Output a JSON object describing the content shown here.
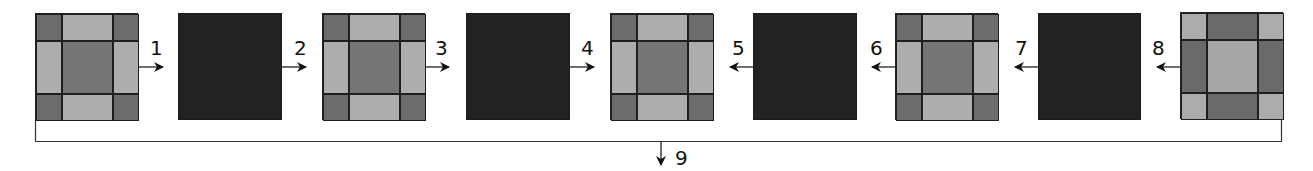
{
  "diagram": {
    "colors": {
      "corner_dark": "#6c6c6c",
      "edge_light": "#adadad",
      "center_mid": "#767676",
      "solid_dark": "#222222",
      "inv_corner_light": "#acacac",
      "inv_edge_dark": "#6a6a6a",
      "inv_center_light": "#a6a6a6",
      "line": "#222222"
    },
    "tiles": [
      {
        "id": "tile-1",
        "type": "patterned",
        "x": 35
      },
      {
        "id": "tile-2",
        "type": "solid",
        "x": 178
      },
      {
        "id": "tile-3",
        "type": "patterned",
        "x": 322
      },
      {
        "id": "tile-4",
        "type": "solid",
        "x": 466
      },
      {
        "id": "tile-5",
        "type": "patterned",
        "x": 610
      },
      {
        "id": "tile-6",
        "type": "solid",
        "x": 753
      },
      {
        "id": "tile-7",
        "type": "patterned",
        "x": 895
      },
      {
        "id": "tile-8",
        "type": "solid",
        "x": 1038
      },
      {
        "id": "tile-9",
        "type": "patterned-inverted",
        "x": 1180
      }
    ],
    "steps": [
      {
        "label": "1",
        "direction": "right"
      },
      {
        "label": "2",
        "direction": "right"
      },
      {
        "label": "3",
        "direction": "right"
      },
      {
        "label": "4",
        "direction": "right"
      },
      {
        "label": "5",
        "direction": "left"
      },
      {
        "label": "6",
        "direction": "left"
      },
      {
        "label": "7",
        "direction": "left"
      },
      {
        "label": "8",
        "direction": "left"
      },
      {
        "label": "9",
        "direction": "down"
      }
    ]
  }
}
